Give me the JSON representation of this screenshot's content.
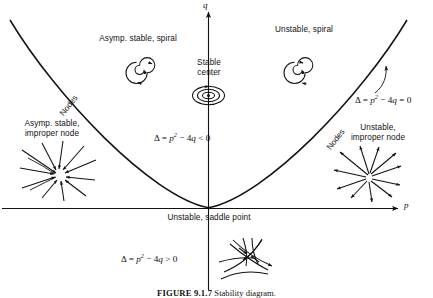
{
  "figure": {
    "caption_label": "FIGURE 9.1.7",
    "caption_text": "Stability diagram.",
    "axes": {
      "x_label": "p",
      "y_label": "q"
    }
  },
  "curve": {
    "equation_label": "Δ = p2 − 4q = 0",
    "delta": "Δ",
    "p_sym": "p",
    "exp2": "2",
    "minus4q": " − 4",
    "q_sym": "q",
    "eq0": " = 0",
    "lt0": " < 0",
    "gt0": " > 0",
    "nodes_left": "Nodes",
    "nodes_right": "Nodes"
  },
  "regions": {
    "inside_inequality": "Δ = p2 − 4q < 0",
    "outside_inequality": "Δ = p2 − 4q > 0",
    "asymp_stable_spiral": "Asymp. stable, spiral",
    "unstable_spiral": "Unstable, spiral",
    "stable_center": "Stable\ncenter",
    "stable_center_line1": "Stable",
    "stable_center_line2": "center",
    "asymp_stable_improper_line1": "Asymp. stable,",
    "asymp_stable_improper_line2": "improper node",
    "unstable_improper_line1": "Unstable,",
    "unstable_improper_line2": "improper node",
    "saddle": "Unstable, saddle point"
  },
  "icons": {
    "spiral_inward": "spiral-inward-icon",
    "spiral_outward": "spiral-outward-icon",
    "center_ellipses": "concentric-ellipses-icon",
    "node_stable": "improper-node-stable-icon",
    "node_unstable": "improper-node-unstable-icon",
    "saddle_sketch": "saddle-phase-portrait-icon"
  },
  "colors": {
    "ink": "#111111",
    "background": "#ffffff"
  }
}
